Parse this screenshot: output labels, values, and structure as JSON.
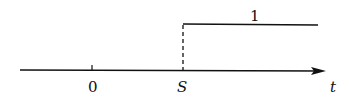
{
  "diagram": {
    "type": "unit step function",
    "axis_label": "t",
    "origin_label": "0",
    "step_label": "S",
    "level_label": "1",
    "colors": {
      "line": "#111111",
      "background": "#ffffff"
    }
  }
}
